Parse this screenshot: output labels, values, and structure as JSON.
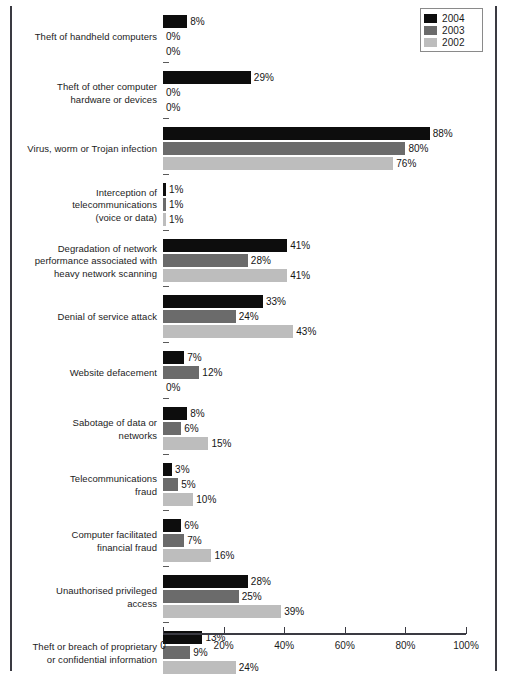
{
  "legend": {
    "position": "top-right",
    "entries": [
      {
        "label": "2004",
        "color": "#0d0d0d"
      },
      {
        "label": "2003",
        "color": "#6b6b6b"
      },
      {
        "label": "2002",
        "color": "#bdbdbd"
      }
    ]
  },
  "axis": {
    "ticks": [
      "0",
      "20%",
      "40%",
      "60%",
      "80%",
      "100%"
    ],
    "min": 0,
    "max": 100
  },
  "chart_data": {
    "type": "bar",
    "orientation": "horizontal",
    "title": "",
    "subtitle": "",
    "xlabel": "",
    "ylabel": "",
    "xlim": [
      0,
      100
    ],
    "grid": false,
    "legend_position": "top-right",
    "value_suffix": "%",
    "categories": [
      "Theft of handheld computers",
      "Theft of other computer hardware or devices",
      "Virus, worm or Trojan infection",
      "Interception of telecommunications (voice or data)",
      "Degradation of network performance associated with heavy network scanning",
      "Denial of service attack",
      "Website defacement",
      "Sabotage of data or networks",
      "Telecommunications fraud",
      "Computer facilitated financial fraud",
      "Unauthorised privileged access",
      "Theft or breach of proprietary or confidential information"
    ],
    "series": [
      {
        "name": "2004",
        "color": "#0d0d0d",
        "values": [
          8,
          29,
          88,
          1,
          41,
          33,
          7,
          8,
          3,
          6,
          28,
          13
        ]
      },
      {
        "name": "2003",
        "color": "#6b6b6b",
        "values": [
          0,
          0,
          80,
          1,
          28,
          24,
          12,
          6,
          5,
          7,
          25,
          9
        ]
      },
      {
        "name": "2002",
        "color": "#bdbdbd",
        "values": [
          0,
          0,
          76,
          1,
          41,
          43,
          0,
          15,
          10,
          16,
          39,
          24
        ]
      }
    ]
  },
  "groups": [
    {
      "label_lines": [
        "Theft of handheld computers"
      ],
      "values": [
        {
          "series": "2004",
          "value": 8,
          "text": "8%",
          "color": "#0d0d0d"
        },
        {
          "series": "2003",
          "value": 0,
          "text": "0%",
          "color": "#6b6b6b"
        },
        {
          "series": "2002",
          "value": 0,
          "text": "0%",
          "color": "#bdbdbd"
        }
      ]
    },
    {
      "label_lines": [
        "Theft of other computer",
        "hardware or devices"
      ],
      "values": [
        {
          "series": "2004",
          "value": 29,
          "text": "29%",
          "color": "#0d0d0d"
        },
        {
          "series": "2003",
          "value": 0,
          "text": "0%",
          "color": "#6b6b6b"
        },
        {
          "series": "2002",
          "value": 0,
          "text": "0%",
          "color": "#bdbdbd"
        }
      ]
    },
    {
      "label_lines": [
        "Virus, worm or Trojan infection"
      ],
      "values": [
        {
          "series": "2004",
          "value": 88,
          "text": "88%",
          "color": "#0d0d0d"
        },
        {
          "series": "2003",
          "value": 80,
          "text": "80%",
          "color": "#6b6b6b"
        },
        {
          "series": "2002",
          "value": 76,
          "text": "76%",
          "color": "#bdbdbd"
        }
      ]
    },
    {
      "label_lines": [
        "Interception of",
        "telecommunications",
        "(voice or data)"
      ],
      "values": [
        {
          "series": "2004",
          "value": 1,
          "text": "1%",
          "color": "#0d0d0d"
        },
        {
          "series": "2003",
          "value": 1,
          "text": "1%",
          "color": "#6b6b6b"
        },
        {
          "series": "2002",
          "value": 1,
          "text": "1%",
          "color": "#bdbdbd"
        }
      ]
    },
    {
      "label_lines": [
        "Degradation of network",
        "performance associated with",
        "heavy network scanning"
      ],
      "values": [
        {
          "series": "2004",
          "value": 41,
          "text": "41%",
          "color": "#0d0d0d"
        },
        {
          "series": "2003",
          "value": 28,
          "text": "28%",
          "color": "#6b6b6b"
        },
        {
          "series": "2002",
          "value": 41,
          "text": "41%",
          "color": "#bdbdbd"
        }
      ]
    },
    {
      "label_lines": [
        "Denial of service attack"
      ],
      "values": [
        {
          "series": "2004",
          "value": 33,
          "text": "33%",
          "color": "#0d0d0d"
        },
        {
          "series": "2003",
          "value": 24,
          "text": "24%",
          "color": "#6b6b6b"
        },
        {
          "series": "2002",
          "value": 43,
          "text": "43%",
          "color": "#bdbdbd"
        }
      ]
    },
    {
      "label_lines": [
        "Website defacement"
      ],
      "values": [
        {
          "series": "2004",
          "value": 7,
          "text": "7%",
          "color": "#0d0d0d"
        },
        {
          "series": "2003",
          "value": 12,
          "text": "12%",
          "color": "#6b6b6b"
        },
        {
          "series": "2002",
          "value": 0,
          "text": "0%",
          "color": "#bdbdbd"
        }
      ]
    },
    {
      "label_lines": [
        "Sabotage of data or",
        "networks"
      ],
      "values": [
        {
          "series": "2004",
          "value": 8,
          "text": "8%",
          "color": "#0d0d0d"
        },
        {
          "series": "2003",
          "value": 6,
          "text": "6%",
          "color": "#6b6b6b"
        },
        {
          "series": "2002",
          "value": 15,
          "text": "15%",
          "color": "#bdbdbd"
        }
      ]
    },
    {
      "label_lines": [
        "Telecommunications",
        "fraud"
      ],
      "values": [
        {
          "series": "2004",
          "value": 3,
          "text": "3%",
          "color": "#0d0d0d"
        },
        {
          "series": "2003",
          "value": 5,
          "text": "5%",
          "color": "#6b6b6b"
        },
        {
          "series": "2002",
          "value": 10,
          "text": "10%",
          "color": "#bdbdbd"
        }
      ]
    },
    {
      "label_lines": [
        "Computer facilitated",
        "financial fraud"
      ],
      "values": [
        {
          "series": "2004",
          "value": 6,
          "text": "6%",
          "color": "#0d0d0d"
        },
        {
          "series": "2003",
          "value": 7,
          "text": "7%",
          "color": "#6b6b6b"
        },
        {
          "series": "2002",
          "value": 16,
          "text": "16%",
          "color": "#bdbdbd"
        }
      ]
    },
    {
      "label_lines": [
        "Unauthorised privileged",
        "access"
      ],
      "values": [
        {
          "series": "2004",
          "value": 28,
          "text": "28%",
          "color": "#0d0d0d"
        },
        {
          "series": "2003",
          "value": 25,
          "text": "25%",
          "color": "#6b6b6b"
        },
        {
          "series": "2002",
          "value": 39,
          "text": "39%",
          "color": "#bdbdbd"
        }
      ]
    },
    {
      "label_lines": [
        "Theft or breach of proprietary",
        "or confidential information"
      ],
      "values": [
        {
          "series": "2004",
          "value": 13,
          "text": "13%",
          "color": "#0d0d0d"
        },
        {
          "series": "2003",
          "value": 9,
          "text": "9%",
          "color": "#6b6b6b"
        },
        {
          "series": "2002",
          "value": 24,
          "text": "24%",
          "color": "#bdbdbd"
        }
      ]
    }
  ]
}
